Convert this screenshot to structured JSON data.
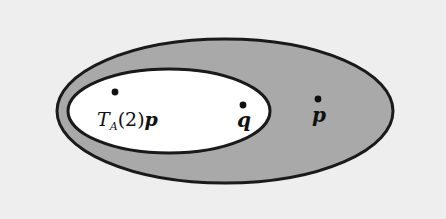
{
  "figure": {
    "name": "nested-ellipse-set-diagram",
    "background_color": "#eeeeee",
    "outer_region": {
      "label": "outer-ellipse",
      "fill_color": "#a9a9a9",
      "stroke_color": "#1a1a1a",
      "cx": 225,
      "cy": 111,
      "rx": 168,
      "ry": 72,
      "stroke_width": 3
    },
    "inner_region": {
      "label": "inner-ellipse",
      "fill_color": "#ffffff",
      "stroke_color": "#1a1a1a",
      "cx": 169,
      "cy": 111,
      "rx": 101,
      "ry": 42,
      "stroke_width": 3
    },
    "points": [
      {
        "name": "point-ta2p",
        "dot_x": 115,
        "dot_y": 92,
        "dot_radius": 3.4,
        "color": "#111111",
        "label_parts": {
          "symbol": "T",
          "subscript": "A",
          "open_paren": "(",
          "argument": "2",
          "close_paren": ")",
          "vector": "p"
        },
        "label_text": "T_A(2)p"
      },
      {
        "name": "point-q",
        "dot_x": 243,
        "dot_y": 105,
        "dot_radius": 3.4,
        "color": "#111111",
        "label_text": "q"
      },
      {
        "name": "point-p",
        "dot_x": 318,
        "dot_y": 99,
        "dot_radius": 3.4,
        "color": "#111111",
        "label_text": "p"
      }
    ]
  }
}
